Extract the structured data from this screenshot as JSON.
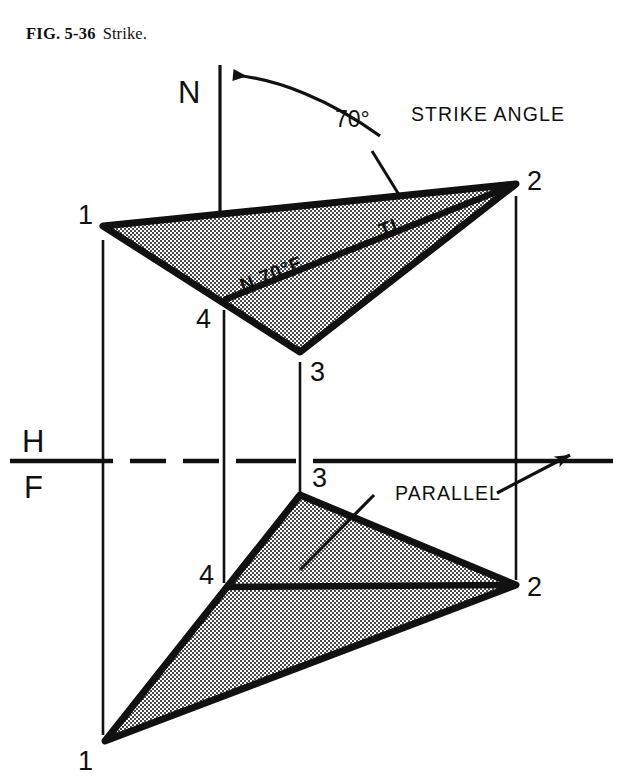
{
  "figure": {
    "caption_number": "FIG. 5-36",
    "caption_title": "Strike.",
    "type": "orthographic-projection-diagram"
  },
  "labels": {
    "north": "N",
    "strike_angle_value": "70°",
    "strike_angle_text": "STRIKE ANGLE",
    "bearing": "N 70°E",
    "true_length": "TL",
    "parallel": "PARALLEL",
    "horizontal_plane": "H",
    "frontal_plane": "F"
  },
  "top_view": {
    "name": "top-view-plane",
    "vertices": [
      {
        "id": "1",
        "label": "1",
        "x": 103,
        "y": 226,
        "label_x": 78,
        "label_y": 224
      },
      {
        "id": "2",
        "label": "2",
        "x": 516,
        "y": 184,
        "label_x": 527,
        "label_y": 190
      },
      {
        "id": "3",
        "label": "3",
        "x": 300,
        "y": 352,
        "label_x": 310,
        "label_y": 380
      },
      {
        "id": "4",
        "label": "4",
        "x": 224,
        "y": 300,
        "label_x": 196,
        "label_y": 327
      }
    ]
  },
  "front_view": {
    "name": "front-view-plane",
    "vertices": [
      {
        "id": "1",
        "label": "1",
        "x": 105,
        "y": 741,
        "label_x": 78,
        "label_y": 768
      },
      {
        "id": "2",
        "label": "2",
        "x": 516,
        "y": 585,
        "label_x": 527,
        "label_y": 594
      },
      {
        "id": "3",
        "label": "3",
        "x": 300,
        "y": 495,
        "label_x": 312,
        "label_y": 486
      },
      {
        "id": "4",
        "label": "4",
        "x": 227,
        "y": 587,
        "label_x": 199,
        "label_y": 583
      }
    ]
  },
  "reference_line": {
    "name": "hf-reference-line",
    "y": 461,
    "x_start": 10,
    "x_end": 630
  },
  "colors": {
    "ink": "#111111",
    "fill_stipple_dark": "#3a3a3a",
    "fill_background": "#ffffff",
    "page": "#ffffff"
  },
  "projection_lines": [
    {
      "name": "projector-1",
      "x": 103,
      "y1": 240,
      "y2": 735
    },
    {
      "name": "projector-2",
      "x": 516,
      "y1": 196,
      "y2": 580
    },
    {
      "name": "projector-3",
      "x": 300,
      "y1": 362,
      "y2": 492
    },
    {
      "name": "projector-4",
      "x": 224,
      "y1": 310,
      "y2": 583
    },
    {
      "name": "north-line",
      "x": 220,
      "y1": 65,
      "y2": 290
    }
  ]
}
